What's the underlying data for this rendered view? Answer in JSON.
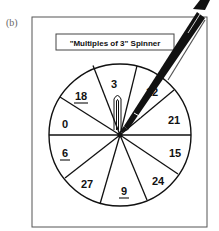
{
  "figure": {
    "label": "(b)",
    "title": "\"Multiples of 3\" Spinner"
  },
  "spinner": {
    "sections": [
      {
        "value": "3",
        "underlined": false
      },
      {
        "value": "12",
        "underlined": false,
        "obscured": true,
        "visible_text": "2"
      },
      {
        "value": "21",
        "underlined": false
      },
      {
        "value": "15",
        "underlined": false
      },
      {
        "value": "24",
        "underlined": false
      },
      {
        "value": "9",
        "underlined": true
      },
      {
        "value": "27",
        "underlined": false
      },
      {
        "value": "6",
        "underlined": true
      },
      {
        "value": "0",
        "underlined": false
      },
      {
        "value": "18",
        "underlined": true
      }
    ],
    "pointer": "paperclip",
    "tool": "pen"
  },
  "colors": {
    "ink": "#111111",
    "background": "#ffffff",
    "border": "#555555"
  }
}
